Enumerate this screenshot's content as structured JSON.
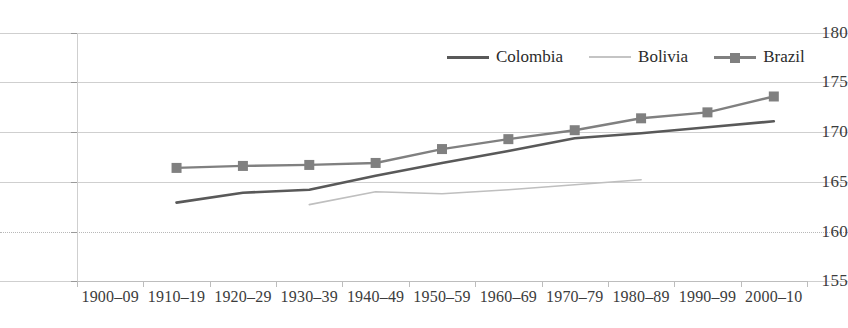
{
  "chart_data": {
    "type": "line",
    "title": "",
    "subtitle": "",
    "xlabel": "",
    "ylabel": "",
    "categories": [
      "1900–09",
      "1910–19",
      "1920–29",
      "1930–39",
      "1940–49",
      "1950–59",
      "1960–69",
      "1970–79",
      "1980–89",
      "1990–99",
      "2000–10"
    ],
    "ylim": [
      155,
      180
    ],
    "yticks": [
      155,
      160,
      165,
      170,
      175,
      180
    ],
    "grid": true,
    "legend_position": "top-right",
    "series": [
      {
        "name": "Colombia",
        "color": "#595959",
        "marker": "none",
        "values": [
          null,
          162.9,
          163.9,
          164.2,
          165.6,
          166.9,
          168.1,
          169.4,
          169.9,
          170.5,
          171.1
        ]
      },
      {
        "name": "Bolivia",
        "color": "#bfbfbf",
        "marker": "none",
        "values": [
          null,
          null,
          null,
          162.7,
          164.0,
          163.8,
          164.2,
          164.7,
          165.2,
          null,
          null
        ]
      },
      {
        "name": "Brazil",
        "color": "#808080",
        "marker": "square",
        "values": [
          null,
          166.4,
          166.6,
          166.7,
          166.9,
          168.3,
          169.3,
          170.2,
          171.4,
          172.0,
          173.6
        ]
      }
    ]
  },
  "axes": {
    "y_tick_labels": [
      "180",
      "175",
      "170",
      "165",
      "160",
      "155"
    ],
    "x_tick_labels": [
      "1900–09",
      "1910–19",
      "1920–29",
      "1930–39",
      "1940–49",
      "1950–59",
      "1960–69",
      "1970–79",
      "1980–89",
      "1990–99",
      "2000–10"
    ]
  },
  "legend": {
    "items": [
      {
        "label": "Colombia",
        "color": "#595959",
        "marker": "line-icon"
      },
      {
        "label": "Bolivia",
        "color": "#c4c4c4",
        "marker": "line-icon"
      },
      {
        "label": "Brazil",
        "color": "#808080",
        "marker": "line-square-icon"
      }
    ]
  },
  "colors": {
    "background": "#ffffff",
    "grid": "#cfcfcf",
    "axis": "#bdbdbd",
    "text": "#3c3c3c",
    "colombia": "#595959",
    "bolivia": "#c4c4c4",
    "brazil": "#808080"
  }
}
